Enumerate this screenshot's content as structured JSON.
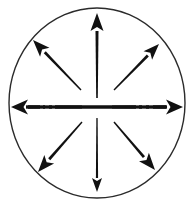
{
  "figure": {
    "description": "A circle containing eight arrows radiating outward from the center toward the circle boundary, plus a horizontal double-headed axis line drawn with broken segments.",
    "pattern_name": "radial-divergence",
    "background_color": "#ffffff",
    "ink_color": "#111111",
    "circle": {
      "name": "boundary-circle",
      "center_x": 97,
      "center_y": 103,
      "radius_x": 88,
      "radius_y": 95,
      "stroke_color": "#2b2b2b",
      "stroke_width": 1.4,
      "fill": "none"
    },
    "horizontal_axis": {
      "name": "horizontal-double-arrow",
      "y": 107,
      "left_tip_x": 11,
      "right_tip_x": 183,
      "stroke_color": "#111111",
      "stroke_width": 3.4,
      "dash_pattern": "broken",
      "segments": [
        {
          "x1": 26,
          "x2": 40
        },
        {
          "x1": 43,
          "x2": 45
        },
        {
          "x1": 49,
          "x2": 52
        },
        {
          "x1": 55,
          "x2": 136
        },
        {
          "x1": 139,
          "x2": 142
        },
        {
          "x1": 146,
          "x2": 149
        },
        {
          "x1": 153,
          "x2": 167
        }
      ],
      "arrowheads": [
        "left",
        "right"
      ]
    },
    "arrows": [
      {
        "name": "arrow-north",
        "direction": "up",
        "angle_deg": 90,
        "tail_x": 97,
        "tail_y": 98,
        "tip_x": 97,
        "tip_y": 13,
        "shaft_width_tail": 1.6,
        "shaft_width_head": 3.0,
        "head_length": 18,
        "head_width": 13
      },
      {
        "name": "arrow-northeast",
        "direction": "up-right",
        "angle_deg": 45,
        "tail_x": 114,
        "tail_y": 90,
        "tip_x": 159,
        "tip_y": 44,
        "shaft_width_tail": 1.4,
        "shaft_width_head": 2.8,
        "head_length": 16,
        "head_width": 12
      },
      {
        "name": "arrow-east",
        "direction": "right",
        "angle_deg": 0,
        "tail_x": 112,
        "tail_y": 107,
        "tip_x": 183,
        "tip_y": 107,
        "shaft_width_tail": 3.2,
        "shaft_width_head": 3.4,
        "head_length": 17,
        "head_width": 15
      },
      {
        "name": "arrow-southeast",
        "direction": "down-right",
        "angle_deg": -45,
        "tail_x": 114,
        "tail_y": 122,
        "tip_x": 155,
        "tip_y": 170,
        "shaft_width_tail": 1.4,
        "shaft_width_head": 2.8,
        "head_length": 17,
        "head_width": 13
      },
      {
        "name": "arrow-south",
        "direction": "down",
        "angle_deg": -90,
        "tail_x": 97,
        "tail_y": 118,
        "tip_x": 97,
        "tip_y": 192,
        "shaft_width_tail": 1.3,
        "shaft_width_head": 2.2,
        "head_length": 14,
        "head_width": 10
      },
      {
        "name": "arrow-southwest",
        "direction": "down-left",
        "angle_deg": -135,
        "tail_x": 82,
        "tail_y": 122,
        "tip_x": 38,
        "tip_y": 172,
        "shaft_width_tail": 1.4,
        "shaft_width_head": 2.8,
        "head_length": 17,
        "head_width": 13
      },
      {
        "name": "arrow-west",
        "direction": "left",
        "angle_deg": 180,
        "tail_x": 82,
        "tail_y": 107,
        "tip_x": 11,
        "tip_y": 107,
        "shaft_width_tail": 3.2,
        "shaft_width_head": 3.4,
        "head_length": 17,
        "head_width": 15
      },
      {
        "name": "arrow-northwest",
        "direction": "up-left",
        "angle_deg": 135,
        "tail_x": 81,
        "tail_y": 90,
        "tip_x": 33,
        "tip_y": 40,
        "shaft_width_tail": 1.4,
        "shaft_width_head": 2.8,
        "head_length": 17,
        "head_width": 13
      }
    ]
  }
}
